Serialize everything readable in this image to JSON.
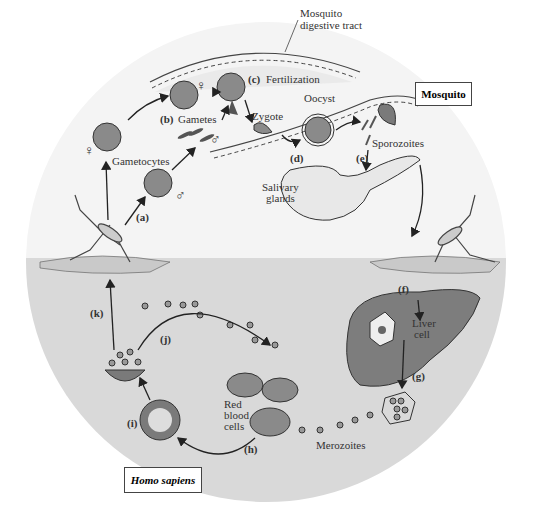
{
  "diagram": {
    "hosts": {
      "mosquito": "Mosquito",
      "human": "Homo sapiens"
    },
    "labels": {
      "digestive_tract_1": "Mosquito",
      "digestive_tract_2": "digestive tract",
      "fertilization": "Fertilization",
      "gametes": "Gametes",
      "gametocytes": "Gametocytes",
      "zygote": "Zygote",
      "oocyst": "Oocyst",
      "sporozoites": "Sporozoites",
      "salivary_1": "Salivary",
      "salivary_2": "glands",
      "liver_1": "Liver",
      "liver_2": "cell",
      "rbc_1": "Red",
      "rbc_2": "blood",
      "rbc_3": "cells",
      "merozoites": "Merozoites",
      "female_symbol": "♀",
      "male_symbol": "♂"
    },
    "steps": {
      "a": "(a)",
      "b": "(b)",
      "c": "(c)",
      "d": "(d)",
      "e": "(e)",
      "f": "(f)",
      "g": "(g)",
      "h": "(h)",
      "i": "(i)",
      "j": "(j)",
      "k": "(k)"
    },
    "colors": {
      "upper_bg": "#f4f4f4",
      "lower_bg": "#d9d9d9",
      "cell_fill": "#8a8a8a",
      "stroke": "#333333"
    }
  }
}
